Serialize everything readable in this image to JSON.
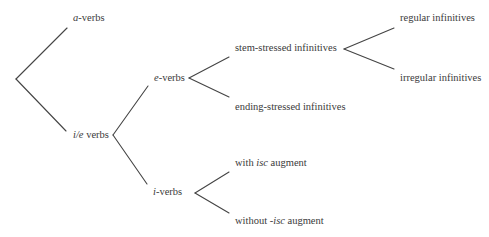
{
  "diagram": {
    "type": "tree",
    "colors": {
      "text": "#3a3a3a",
      "edge": "#444444",
      "background": "#ffffff"
    },
    "nodes": {
      "a_verbs": {
        "italic": "a",
        "rest": "-verbs"
      },
      "ile_verbs": {
        "italic": "i/e",
        "rest": " verbs"
      },
      "e_verbs": {
        "italic": "e",
        "rest": "-verbs"
      },
      "i_verbs": {
        "italic": "i",
        "rest": "-verbs"
      },
      "stem_stressed": {
        "label": "stem-stressed infinitives"
      },
      "ending_stressed": {
        "label": "ending-stressed infinitives"
      },
      "regular": {
        "label": "regular infinitives"
      },
      "irregular": {
        "label": "irregular infinitives"
      },
      "with_isc": {
        "pre": "with ",
        "italic": "isc",
        "post": " augment"
      },
      "without_isc": {
        "pre": "without -",
        "italic": "isc",
        "post": " augment"
      }
    },
    "edges": [
      {
        "from": "root",
        "to": "a_verbs"
      },
      {
        "from": "root",
        "to": "ile_verbs"
      },
      {
        "from": "ile_verbs",
        "to": "e_verbs"
      },
      {
        "from": "ile_verbs",
        "to": "i_verbs"
      },
      {
        "from": "e_verbs",
        "to": "stem_stressed"
      },
      {
        "from": "e_verbs",
        "to": "ending_stressed"
      },
      {
        "from": "stem_stressed",
        "to": "regular"
      },
      {
        "from": "stem_stressed",
        "to": "irregular"
      },
      {
        "from": "i_verbs",
        "to": "with_isc"
      },
      {
        "from": "i_verbs",
        "to": "without_isc"
      }
    ]
  }
}
